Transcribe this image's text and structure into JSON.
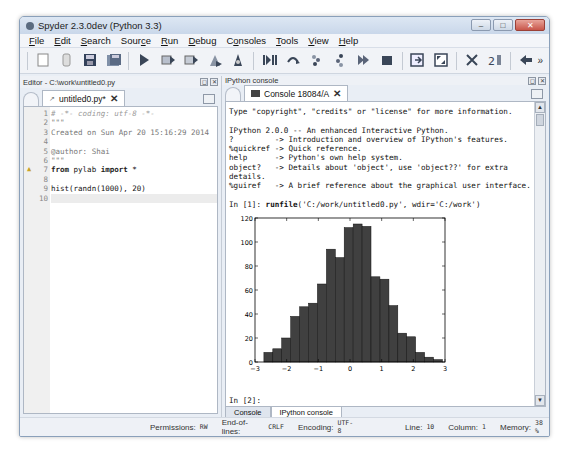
{
  "window": {
    "title": "Spyder 2.3.0dev (Python 3.3)",
    "controls": {
      "minimize": "–",
      "maximize": "□",
      "close": "✕"
    }
  },
  "menubar": {
    "items": [
      {
        "label": "File",
        "mnemonic": "F"
      },
      {
        "label": "Edit",
        "mnemonic": "E"
      },
      {
        "label": "Search",
        "mnemonic": "S"
      },
      {
        "label": "Source",
        "mnemonic": "c"
      },
      {
        "label": "Run",
        "mnemonic": "R"
      },
      {
        "label": "Debug",
        "mnemonic": "D"
      },
      {
        "label": "Consoles",
        "mnemonic": "o"
      },
      {
        "label": "Tools",
        "mnemonic": "T"
      },
      {
        "label": "View",
        "mnemonic": "V"
      },
      {
        "label": "Help",
        "mnemonic": "H"
      }
    ]
  },
  "toolbar": {
    "buttons": [
      "new-file",
      "open-file",
      "save-file",
      "save-all",
      "run",
      "run-cell",
      "run-cell-advance",
      "run-selection",
      "debug",
      "debug-continue",
      "step",
      "step-into",
      "step-return",
      "continue",
      "stop",
      "maximize-pane",
      "fullscreen",
      "preferences",
      "pythonpath",
      "back"
    ],
    "more": "»"
  },
  "editor": {
    "pane_title": "Editor - C:\\work\\untitled0.py",
    "tab_label": "untitled0.py*",
    "lines": [
      {
        "n": "1",
        "text": "# -*- coding: utf-8 -*-",
        "kind": "comment"
      },
      {
        "n": "2",
        "text": "\"\"\"",
        "kind": "str"
      },
      {
        "n": "3",
        "text": "Created on Sun Apr 20 15:16:29 2014",
        "kind": "str"
      },
      {
        "n": "4",
        "text": "",
        "kind": "str"
      },
      {
        "n": "5",
        "text": "@author: Shai",
        "kind": "str"
      },
      {
        "n": "6",
        "text": "\"\"\"",
        "kind": "str"
      },
      {
        "n": "7",
        "text": "from pylab import *",
        "kind": "code",
        "warning": true
      },
      {
        "n": "8",
        "text": "",
        "kind": "code"
      },
      {
        "n": "9",
        "text": "hist(randn(1000), 20)",
        "kind": "code"
      },
      {
        "n": "10",
        "text": "",
        "kind": "current"
      }
    ]
  },
  "console": {
    "pane_title": "IPython console",
    "tab_label": "Console 18084/A",
    "lines": [
      "Type \"copyright\", \"credits\" or \"license\" for more information.",
      "",
      "IPython 2.0.0 -- An enhanced Interactive Python.",
      "?         -> Introduction and overview of IPython's features.",
      "%quickref -> Quick reference.",
      "help      -> Python's own help system.",
      "object?   -> Details about 'object', use 'object??' for extra",
      "details.",
      "%guiref   -> A brief reference about the graphical user interface.",
      "",
      "In [1]: runfile('C:/work/untitled0.py', wdir='C:/work')"
    ],
    "prompt": "In [2]:",
    "bottom_tabs": [
      "Console",
      "IPython console"
    ]
  },
  "statusbar": {
    "permissions_label": "Permissions:",
    "permissions_value": "RW",
    "eol_label": "End-of-lines:",
    "eol_value": "CRLF",
    "encoding_label": "Encoding:",
    "encoding_value": "UTF-8",
    "line_label": "Line:",
    "line_value": "10",
    "column_label": "Column:",
    "column_value": "1",
    "memory_label": "Memory:",
    "memory_value": "38 %"
  },
  "chart_data": {
    "type": "bar",
    "title": "",
    "xlabel": "",
    "ylabel": "",
    "xlim": [
      -3,
      3
    ],
    "ylim": [
      0,
      120
    ],
    "xticks": [
      "-3",
      "-2",
      "-1",
      "0",
      "1",
      "2",
      "3"
    ],
    "yticks": [
      "0",
      "20",
      "40",
      "60",
      "80",
      "100",
      "120"
    ],
    "bin_start": -2.72,
    "bin_width": 0.282,
    "values": [
      8,
      11,
      20,
      38,
      46,
      49,
      65,
      94,
      87,
      112,
      115,
      113,
      71,
      69,
      47,
      24,
      21,
      8,
      4,
      2
    ],
    "bar_color": "#404040",
    "grid": false
  }
}
